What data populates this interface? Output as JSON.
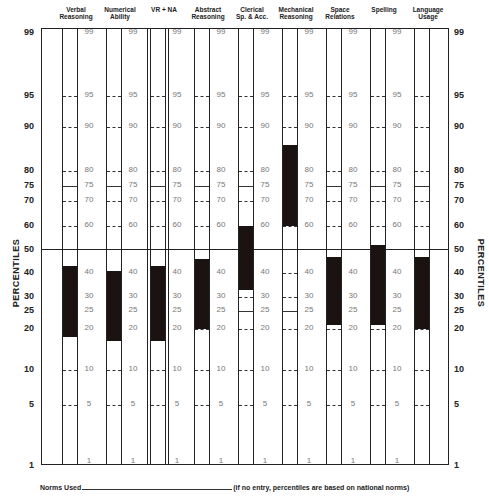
{
  "chart_data": {
    "type": "bar",
    "subtype": "floating-percentile-band-profile",
    "title": "",
    "ylabel": "PERCENTILES",
    "y_scale": "normal-probability (percentile)",
    "y_ticks": [
      99,
      95,
      90,
      80,
      75,
      70,
      60,
      50,
      40,
      30,
      25,
      20,
      10,
      5,
      1
    ],
    "ylim": [
      1,
      99
    ],
    "reference_line": 50,
    "categories": [
      "Verbal Reasoning",
      "Numerical Ability",
      "VR + NA",
      "Abstract Reasoning",
      "Clerical Sp. & Acc.",
      "Mechanical Reasoning",
      "Space Relations",
      "Spelling",
      "Language Usage"
    ],
    "series": [
      {
        "name": "band_top",
        "values": [
          43,
          41,
          43,
          46,
          60,
          86,
          47,
          52,
          47
        ]
      },
      {
        "name": "band_bottom",
        "values": [
          18,
          17,
          17,
          20,
          33,
          60,
          21,
          21,
          20
        ]
      }
    ],
    "legend": [],
    "grid": false
  },
  "headers": [
    {
      "label": "Verbal\nReasoning",
      "x": 42
    },
    {
      "label": "Numerical\nAbility",
      "x": 86
    },
    {
      "label": "VR + NA",
      "x": 130
    },
    {
      "label": "Abstract\nReasoning",
      "x": 174
    },
    {
      "label": "Clerical\nSp. & Acc.",
      "x": 218
    },
    {
      "label": "Mechanical\nReasoning",
      "x": 262
    },
    {
      "label": "Space\nRelations",
      "x": 306
    },
    {
      "label": "Spelling",
      "x": 350
    },
    {
      "label": "Language\nUsage",
      "x": 394
    }
  ],
  "axis": {
    "title_left": "PERCENTILES",
    "title_right": "PERCENTILES",
    "labels": [
      {
        "v": "99",
        "y": 33
      },
      {
        "v": "95",
        "y": 96
      },
      {
        "v": "90",
        "y": 127
      },
      {
        "v": "80",
        "y": 171
      },
      {
        "v": "75",
        "y": 186
      },
      {
        "v": "70",
        "y": 201
      },
      {
        "v": "60",
        "y": 226
      },
      {
        "v": "50",
        "y": 250
      },
      {
        "v": "40",
        "y": 273
      },
      {
        "v": "30",
        "y": 297
      },
      {
        "v": "25",
        "y": 311
      },
      {
        "v": "20",
        "y": 329
      },
      {
        "v": "10",
        "y": 370
      },
      {
        "v": "5",
        "y": 405
      },
      {
        "v": "1",
        "y": 466
      }
    ]
  },
  "footer": {
    "label": "Norms Used",
    "note": "(if no entry, percentiles are based on national norms)"
  }
}
